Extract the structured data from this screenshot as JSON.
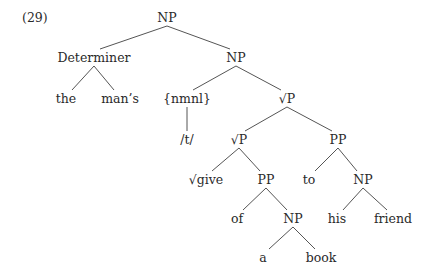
{
  "example_number": "(29)",
  "tree": {
    "nodes": [
      {
        "id": "n0",
        "label": "NP",
        "x": 167,
        "y": 22
      },
      {
        "id": "n1",
        "label": "Determiner",
        "x": 94,
        "y": 62
      },
      {
        "id": "n2",
        "label": "NP",
        "x": 236,
        "y": 62
      },
      {
        "id": "n3",
        "label": "the",
        "x": 66,
        "y": 103
      },
      {
        "id": "n4",
        "label": "man’s",
        "x": 120,
        "y": 103
      },
      {
        "id": "n5",
        "label": "{nmnl}",
        "x": 187,
        "y": 103
      },
      {
        "id": "n6",
        "label": "√P",
        "x": 287,
        "y": 103
      },
      {
        "id": "n7",
        "label": "/t/",
        "x": 187,
        "y": 144
      },
      {
        "id": "n8",
        "label": "√P",
        "x": 239,
        "y": 144
      },
      {
        "id": "n9",
        "label": "PP",
        "x": 338,
        "y": 144
      },
      {
        "id": "n10",
        "label": "√give",
        "x": 206,
        "y": 184
      },
      {
        "id": "n11",
        "label": "PP",
        "x": 266,
        "y": 184
      },
      {
        "id": "n12",
        "label": "to",
        "x": 309,
        "y": 184
      },
      {
        "id": "n13",
        "label": "NP",
        "x": 363,
        "y": 184
      },
      {
        "id": "n14",
        "label": "of",
        "x": 237,
        "y": 223
      },
      {
        "id": "n15",
        "label": "NP",
        "x": 293,
        "y": 223
      },
      {
        "id": "n16",
        "label": "his",
        "x": 337,
        "y": 223
      },
      {
        "id": "n17",
        "label": "friend",
        "x": 393,
        "y": 223
      },
      {
        "id": "n18",
        "label": "a",
        "x": 263,
        "y": 262
      },
      {
        "id": "n19",
        "label": "book",
        "x": 321,
        "y": 262
      }
    ],
    "edges": [
      [
        "n0",
        "n1"
      ],
      [
        "n0",
        "n2"
      ],
      [
        "n1",
        "n3"
      ],
      [
        "n1",
        "n4"
      ],
      [
        "n2",
        "n5"
      ],
      [
        "n2",
        "n6"
      ],
      [
        "n5",
        "n7"
      ],
      [
        "n6",
        "n8"
      ],
      [
        "n6",
        "n9"
      ],
      [
        "n8",
        "n10"
      ],
      [
        "n8",
        "n11"
      ],
      [
        "n9",
        "n12"
      ],
      [
        "n9",
        "n13"
      ],
      [
        "n11",
        "n14"
      ],
      [
        "n11",
        "n15"
      ],
      [
        "n13",
        "n16"
      ],
      [
        "n13",
        "n17"
      ],
      [
        "n15",
        "n18"
      ],
      [
        "n15",
        "n19"
      ]
    ]
  }
}
